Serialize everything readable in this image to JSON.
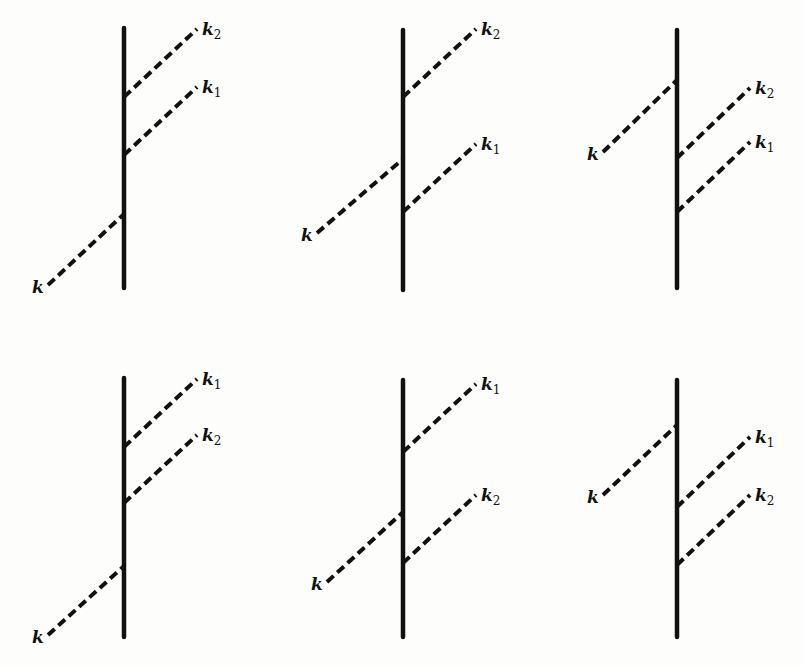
{
  "figure": {
    "line_color": "#111111",
    "background": "#fdfdfb"
  },
  "diagrams": [
    {
      "id": "d1",
      "incoming": {
        "label": "k",
        "side": "left",
        "vertex_order": 3
      },
      "outgoing": [
        {
          "label": "k",
          "sub": "2",
          "vertex_order": 1
        },
        {
          "label": "k",
          "sub": "1",
          "vertex_order": 2
        }
      ]
    },
    {
      "id": "d2",
      "incoming": {
        "label": "k",
        "side": "left",
        "vertex_order": 2
      },
      "outgoing": [
        {
          "label": "k",
          "sub": "2",
          "vertex_order": 1
        },
        {
          "label": "k",
          "sub": "1",
          "vertex_order": 3
        }
      ]
    },
    {
      "id": "d3",
      "incoming": {
        "label": "k",
        "side": "left",
        "vertex_order": 1
      },
      "outgoing": [
        {
          "label": "k",
          "sub": "2",
          "vertex_order": 2
        },
        {
          "label": "k",
          "sub": "1",
          "vertex_order": 3
        }
      ]
    },
    {
      "id": "d4",
      "incoming": {
        "label": "k",
        "side": "left",
        "vertex_order": 3
      },
      "outgoing": [
        {
          "label": "k",
          "sub": "1",
          "vertex_order": 1
        },
        {
          "label": "k",
          "sub": "2",
          "vertex_order": 2
        }
      ]
    },
    {
      "id": "d5",
      "incoming": {
        "label": "k",
        "side": "left",
        "vertex_order": 2
      },
      "outgoing": [
        {
          "label": "k",
          "sub": "1",
          "vertex_order": 1
        },
        {
          "label": "k",
          "sub": "2",
          "vertex_order": 3
        }
      ]
    },
    {
      "id": "d6",
      "incoming": {
        "label": "k",
        "side": "left",
        "vertex_order": 1
      },
      "outgoing": [
        {
          "label": "k",
          "sub": "1",
          "vertex_order": 2
        },
        {
          "label": "k",
          "sub": "2",
          "vertex_order": 3
        }
      ]
    }
  ]
}
